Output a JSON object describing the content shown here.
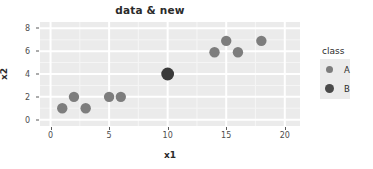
{
  "chart_data": {
    "type": "scatter",
    "title": "data & new",
    "xlabel": "x1",
    "ylabel": "x2",
    "xlim": [
      -0.9,
      21.3
    ],
    "ylim": [
      -0.55,
      8.55
    ],
    "xticks": [
      "0",
      "5",
      "10",
      "15",
      "20"
    ],
    "xtick_values": [
      0,
      5,
      10,
      15,
      20
    ],
    "yticks": [
      "0",
      "2",
      "4",
      "6",
      "8"
    ],
    "ytick_values": [
      0,
      2,
      4,
      6,
      8
    ],
    "grid": true,
    "legend": {
      "title": "class",
      "position": "right",
      "entries": [
        {
          "label": "A",
          "color": "#7d7d7d",
          "size": 7
        },
        {
          "label": "B",
          "color": "#4a4a4a",
          "size": 9
        }
      ]
    },
    "series": [
      {
        "name": "A",
        "color": "#7d7d7d",
        "point_size": 5.2,
        "points": [
          {
            "x": 1,
            "y": 1
          },
          {
            "x": 2,
            "y": 2
          },
          {
            "x": 3,
            "y": 1
          },
          {
            "x": 5,
            "y": 2
          },
          {
            "x": 6,
            "y": 2
          },
          {
            "x": 14,
            "y": 5.9
          },
          {
            "x": 15,
            "y": 6.9
          },
          {
            "x": 16,
            "y": 5.9
          },
          {
            "x": 18,
            "y": 6.9
          }
        ]
      },
      {
        "name": "B",
        "color": "#3a3a3a",
        "point_size": 6.4,
        "points": [
          {
            "x": 10,
            "y": 4
          }
        ]
      }
    ],
    "colors": {
      "panel_background": "#ebebeb",
      "grid_major": "#ffffff",
      "grid_minor": "#f5f5f5",
      "page_background": "#ffffff",
      "text": "#2b2b2b",
      "tick_text": "#4d4d4d"
    }
  }
}
